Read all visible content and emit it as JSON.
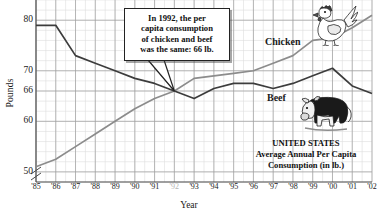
{
  "chart_data": {
    "type": "line",
    "title": "",
    "xlabel": "Year",
    "ylabel": "Pounds",
    "ylim": [
      48,
      84
    ],
    "xlim": [
      1985,
      2002
    ],
    "grid": true,
    "axis_break": true,
    "legend": "inline-labels",
    "y_ticks": [
      {
        "value": 80,
        "label": "80"
      },
      {
        "value": 70,
        "label": "70"
      },
      {
        "value": 66,
        "label": "66"
      },
      {
        "value": 60,
        "label": "60"
      },
      {
        "value": 50,
        "label": "50"
      }
    ],
    "x_ticks": [
      {
        "value": 1985,
        "label": "'85",
        "dim": false
      },
      {
        "value": 1986,
        "label": "'86",
        "dim": false
      },
      {
        "value": 1987,
        "label": "'87",
        "dim": false
      },
      {
        "value": 1988,
        "label": "'88",
        "dim": false
      },
      {
        "value": 1989,
        "label": "'89",
        "dim": false
      },
      {
        "value": 1990,
        "label": "'90",
        "dim": false
      },
      {
        "value": 1991,
        "label": "'91",
        "dim": false
      },
      {
        "value": 1992,
        "label": "'92",
        "dim": true
      },
      {
        "value": 1993,
        "label": "'93",
        "dim": false
      },
      {
        "value": 1994,
        "label": "'94",
        "dim": false
      },
      {
        "value": 1995,
        "label": "'95",
        "dim": false
      },
      {
        "value": 1996,
        "label": "'96",
        "dim": false
      },
      {
        "value": 1997,
        "label": "'97",
        "dim": false
      },
      {
        "value": 1998,
        "label": "'98",
        "dim": false
      },
      {
        "value": 1999,
        "label": "'99",
        "dim": false
      },
      {
        "value": 2000,
        "label": "'00",
        "dim": false
      },
      {
        "value": 2001,
        "label": "'01",
        "dim": false
      },
      {
        "value": 2002,
        "label": "'02",
        "dim": false
      }
    ],
    "x": [
      1985,
      1986,
      1987,
      1988,
      1989,
      1990,
      1991,
      1992,
      1993,
      1994,
      1995,
      1996,
      1997,
      1998,
      1999,
      2000,
      2001,
      2002
    ],
    "series": [
      {
        "name": "Beef",
        "color": "#3c3c3c",
        "values": [
          79,
          79,
          73,
          71.5,
          70,
          68.5,
          67.5,
          66,
          64.5,
          66.5,
          67.5,
          67.5,
          66.5,
          67.5,
          69,
          70.5,
          67,
          65.5
        ]
      },
      {
        "name": "Chicken",
        "color": "#8c8c8c",
        "values": [
          51,
          52.5,
          55,
          57.5,
          60,
          62.5,
          64.5,
          66,
          68.5,
          69,
          69.5,
          70,
          71.5,
          73,
          76,
          76.5,
          78.5,
          81
        ]
      }
    ]
  },
  "axis": {
    "ylabel": "Pounds",
    "xlabel": "Year"
  },
  "callout": {
    "line1": "In 1992, the per",
    "line2": "capita consumption",
    "line3": "of chicken and beef",
    "line4": "was the same: 66 lb.",
    "anchor_year": 1992,
    "anchor_value": 66
  },
  "series_labels": {
    "chicken": "Chicken",
    "beef": "Beef"
  },
  "caption": {
    "line1": "UNITED STATES",
    "line2": "Average Annual Per Capita",
    "line3": "Consumption (in lb.)"
  },
  "icons": {
    "rooster": "rooster-icon",
    "cow": "cow-icon"
  },
  "colors": {
    "beef_line": "#3c3c3c",
    "chicken_line": "#8c8c8c",
    "grid_major": "#9a9a9a",
    "grid_minor": "#d8d8d8",
    "axis": "#4a4a4a",
    "text": "#1a1a1a"
  }
}
